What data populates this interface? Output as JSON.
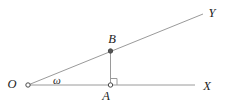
{
  "figure": {
    "width": 226,
    "height": 107,
    "colors": {
      "background": "#ffffff",
      "line": "#9a9a9a",
      "point_stroke": "#4a4a4a",
      "point_solid_fill": "#565656",
      "point_open_fill": "#ffffff",
      "text": "#222222"
    },
    "labels": {
      "origin": "O",
      "angle": "ω",
      "point_b": "B",
      "point_a": "A",
      "ray_x": "X",
      "ray_y": "Y"
    },
    "geometry": {
      "segments": [
        {
          "name": "ray-OX-line",
          "x1": 28,
          "y1": 85,
          "x2": 195,
          "y2": 85
        },
        {
          "name": "ray-OY-line",
          "x1": 28,
          "y1": 85,
          "x2": 203,
          "y2": 14
        },
        {
          "name": "segment-BA-line",
          "x1": 110.5,
          "y1": 51,
          "x2": 110.5,
          "y2": 85
        }
      ],
      "right_angle_mark": {
        "name": "right-angle-mark",
        "points": "110.5,78.5 117,78.5 117,85"
      },
      "points": [
        {
          "name": "point-O-marker",
          "x": 28,
          "y": 85,
          "r": 2.2,
          "style": "open"
        },
        {
          "name": "point-B-marker",
          "x": 110.5,
          "y": 51,
          "r": 2.2,
          "style": "solid"
        },
        {
          "name": "point-A-marker",
          "x": 110.5,
          "y": 85,
          "r": 2.2,
          "style": "open"
        }
      ],
      "texts": [
        {
          "name": "label-origin-O",
          "key": "origin",
          "x": 12,
          "y": 87.5,
          "size": 12.5
        },
        {
          "name": "label-angle-omega",
          "key": "angle",
          "x": 57,
          "y": 83.5,
          "size": 11
        },
        {
          "name": "label-point-B",
          "key": "point_b",
          "x": 112,
          "y": 43,
          "size": 12.5
        },
        {
          "name": "label-point-A",
          "key": "point_a",
          "x": 106,
          "y": 99.5,
          "size": 12.5
        },
        {
          "name": "label-ray-X",
          "key": "ray_x",
          "x": 207,
          "y": 90,
          "size": 12.5
        },
        {
          "name": "label-ray-Y",
          "key": "ray_y",
          "x": 212,
          "y": 17,
          "size": 12.5
        }
      ]
    }
  }
}
